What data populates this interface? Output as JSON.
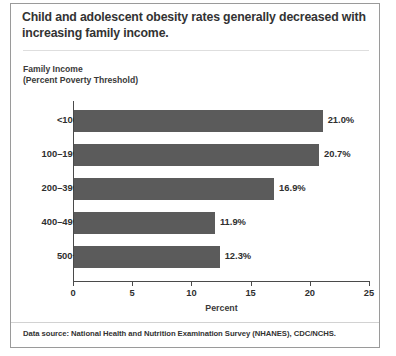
{
  "figure": {
    "title": {
      "light_part": "Child and adolescent obesity rates generally ",
      "bold_part": "decreased with increasing family income."
    },
    "axis_caption_line1": "Family Income",
    "axis_caption_line2": "(Percent Poverty Threshold)",
    "footer": {
      "label": "Data source:",
      "text": " National Health and Nutrition Examination Survey (NHANES), CDC/NCHS."
    },
    "colors": {
      "bar": "#5b5b5b",
      "axis": "#4a4a4a",
      "frame": "#9a9a9a",
      "text": "#2f2f2f"
    }
  },
  "chart_data": {
    "type": "bar",
    "orientation": "horizontal",
    "title": "Child and adolescent obesity rates generally decreased with increasing family income.",
    "xlabel": "Percent",
    "ylabel": "Family Income (Percent Poverty Threshold)",
    "categories": [
      "<100",
      "100–199",
      "200–399",
      "400–499",
      "500+"
    ],
    "values": [
      21.0,
      20.7,
      16.9,
      11.9,
      12.3
    ],
    "data_labels": [
      "21.0%",
      "20.7%",
      "16.9%",
      "11.9%",
      "12.3%"
    ],
    "xlim": [
      0,
      25
    ],
    "xticks": [
      0,
      5,
      10,
      15,
      20,
      25
    ],
    "xtick_labels": [
      "0",
      "5",
      "10",
      "15",
      "20",
      "25"
    ],
    "grid": false,
    "legend": false,
    "series": [
      {
        "name": "Obesity rate",
        "values": [
          21.0,
          20.7,
          16.9,
          11.9,
          12.3
        ]
      }
    ]
  }
}
